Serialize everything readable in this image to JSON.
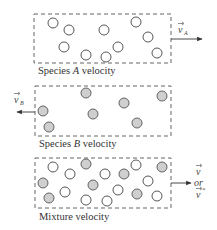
{
  "diagram": {
    "panels": [
      {
        "id": "species-a",
        "label_prefix": "Species ",
        "label_species": "A",
        "label_suffix": " velocity",
        "velocity_symbol": "v",
        "velocity_subscript": "A",
        "arrow_direction": "right",
        "particle_type": "open"
      },
      {
        "id": "species-b",
        "label_prefix": "Species ",
        "label_species": "B",
        "label_suffix": " velocity",
        "velocity_symbol": "v",
        "velocity_subscript": "B",
        "arrow_direction": "left",
        "particle_type": "filled"
      },
      {
        "id": "mixture",
        "label": "Mixture velocity",
        "velocity_symbol_1": "v",
        "velocity_or": "or",
        "velocity_symbol_2": "v",
        "velocity_symbol_2_superscript": "*",
        "arrow_direction": "right",
        "particle_type": "mixed"
      }
    ],
    "colors": {
      "open_particle_fill": "#ffffff",
      "filled_particle_fill": "#cfcfcf",
      "stroke": "#555555"
    }
  }
}
